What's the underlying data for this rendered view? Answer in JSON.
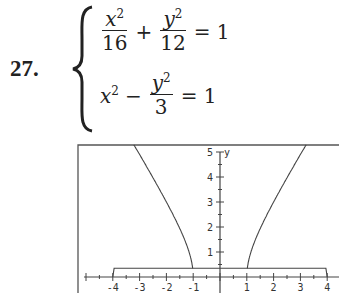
{
  "problem": {
    "number": "27.",
    "equations": [
      {
        "term1_num": "x",
        "term1_den": "16",
        "op": "+",
        "term2_num": "y",
        "term2_den": "12",
        "rhs": "= 1"
      },
      {
        "lead": "x",
        "op": "−",
        "term2_num": "y",
        "term2_den": "3",
        "rhs": "= 1"
      }
    ],
    "exp": "2"
  },
  "chart_data": {
    "type": "line",
    "title": "",
    "xlabel": "",
    "ylabel": "y",
    "xlim": [
      -4.3,
      4.3
    ],
    "ylim": [
      0,
      5
    ],
    "x_ticks": [
      "-4",
      "-3",
      "-2",
      "-1",
      "1",
      "2",
      "3",
      "4"
    ],
    "y_ticks": [
      "1",
      "2",
      "3",
      "4",
      "5"
    ],
    "grid": false,
    "series": [
      {
        "name": "ellipse x^2/16 + y^2/12 = 1 (upper half)",
        "equation": "y = sqrt(12(1 - x^2/16))",
        "x_range": [
          -4,
          4
        ],
        "peak": [
          0,
          3.46
        ]
      },
      {
        "name": "hyperbola x^2 - y^2/3 = 1 (left branch)",
        "equation": "y = sqrt(3(x^2 - 1))",
        "x_range": [
          -3.1,
          -1
        ]
      },
      {
        "name": "hyperbola x^2 - y^2/3 = 1 (right branch)",
        "equation": "y = sqrt(3(x^2 - 1))",
        "x_range": [
          1,
          3.1
        ]
      }
    ],
    "intersections": [
      [
        -2,
        3
      ],
      [
        2,
        3
      ]
    ]
  }
}
